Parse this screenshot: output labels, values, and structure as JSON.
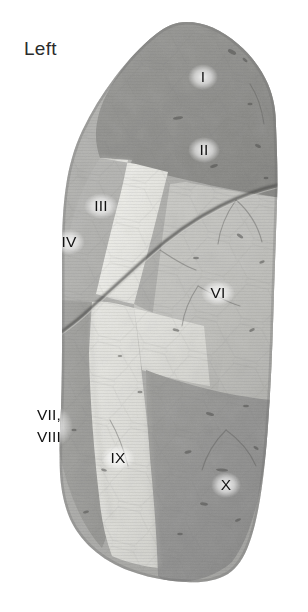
{
  "figure": {
    "side_label": "Left",
    "orientation": "lateral view",
    "background_color": "#ffffff",
    "label_color": "#121212",
    "fissure_color": "#4a4a4a"
  },
  "segments": [
    {
      "id": "I",
      "label": "I",
      "x": 203,
      "y": 77,
      "lobe": "upper",
      "tone": "#8e8e8e"
    },
    {
      "id": "II",
      "label": "II",
      "x": 204,
      "y": 150,
      "lobe": "upper",
      "tone": "#8e8e8e"
    },
    {
      "id": "III",
      "label": "III",
      "x": 101,
      "y": 206,
      "lobe": "upper",
      "tone": "#e8e8e4"
    },
    {
      "id": "IV",
      "label": "IV",
      "x": 69,
      "y": 242,
      "lobe": "upper",
      "tone": "#b4b4b2"
    },
    {
      "id": "VI",
      "label": "VI",
      "x": 218,
      "y": 293,
      "lobe": "lower",
      "tone": "#c2c2bf"
    },
    {
      "id": "VII-VIII",
      "label": "VII,",
      "label2": "VIII",
      "x": 49,
      "y": 426,
      "lobe": "lower",
      "tone": "#9d9d9b"
    },
    {
      "id": "IX",
      "label": "IX",
      "x": 118,
      "y": 458,
      "lobe": "lower",
      "tone": "#dedeDA"
    },
    {
      "id": "X",
      "label": "X",
      "x": 226,
      "y": 485,
      "lobe": "lower",
      "tone": "#919191"
    }
  ],
  "features": {
    "oblique_fissure": "curved dark line from upper posterior border to anterior inferior border",
    "lobes": [
      "upper lobe",
      "lower lobe"
    ]
  }
}
